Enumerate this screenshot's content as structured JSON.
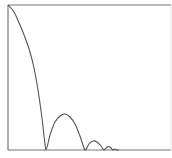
{
  "chart_data": {
    "type": "line",
    "title": "",
    "xlabel": "",
    "ylabel": "",
    "grid": false,
    "legend": null,
    "series": [
      {
        "name": "response",
        "color": "#555555",
        "points": [
          [
            8,
            5
          ],
          [
            14,
            12
          ],
          [
            20,
            25
          ],
          [
            26,
            40
          ],
          [
            30,
            52
          ],
          [
            34,
            68
          ],
          [
            38,
            90
          ],
          [
            42,
            118
          ],
          [
            46,
            150
          ],
          [
            50,
            135
          ],
          [
            55,
            122
          ],
          [
            60,
            116
          ],
          [
            65,
            114
          ],
          [
            70,
            117
          ],
          [
            75,
            124
          ],
          [
            80,
            136
          ],
          [
            85,
            150
          ],
          [
            89,
            144
          ],
          [
            93,
            141
          ],
          [
            97,
            142
          ],
          [
            101,
            146
          ],
          [
            104,
            150
          ],
          [
            107,
            147
          ],
          [
            110,
            147
          ],
          [
            113,
            150
          ],
          [
            115,
            149
          ],
          [
            117,
            150
          ],
          [
            119,
            150
          ]
        ]
      }
    ],
    "frame": {
      "left": 8,
      "top": 5,
      "right": 171,
      "bottom": 150
    },
    "axis_color": "#777777",
    "right_border_color": "#e6e6e6"
  }
}
